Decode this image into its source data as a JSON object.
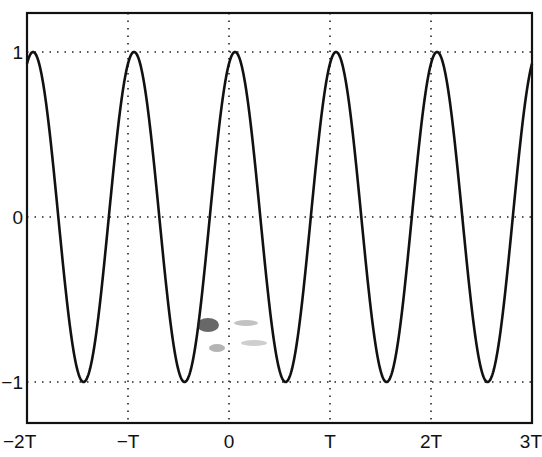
{
  "chart_data": {
    "type": "line",
    "title": "",
    "xlabel": "",
    "ylabel": "",
    "xlim": [
      -2,
      3
    ],
    "ylim": [
      -1.2,
      1.2
    ],
    "x_unit": "T",
    "grid": true,
    "x_ticks": [
      {
        "value": -2,
        "label": "−2T"
      },
      {
        "value": -1,
        "label": "−T"
      },
      {
        "value": 0,
        "label": "0"
      },
      {
        "value": 1,
        "label": "T"
      },
      {
        "value": 2,
        "label": "2T"
      },
      {
        "value": 3,
        "label": "3T"
      }
    ],
    "y_ticks": [
      {
        "value": 1,
        "label": "1"
      },
      {
        "value": 0,
        "label": "0"
      },
      {
        "value": -1,
        "label": "−1"
      }
    ],
    "series": [
      {
        "name": "periodic signal",
        "function": "cos(2*pi*(t - 0.06))",
        "period": 1,
        "amplitude": 1,
        "phase_shift": 0.06,
        "peaks_at": [
          -1.94,
          -0.94,
          0.06,
          1.06,
          2.06
        ],
        "troughs_at": [
          -1.44,
          -0.44,
          0.56,
          1.56,
          2.56
        ],
        "x": [
          -2.0,
          -1.94,
          -1.69,
          -1.44,
          -1.19,
          -0.94,
          -0.69,
          -0.44,
          -0.19,
          0.06,
          0.31,
          0.56,
          0.81,
          1.06,
          1.31,
          1.56,
          1.81,
          2.06,
          2.31,
          2.56,
          2.81,
          3.0
        ],
        "values": [
          0.93,
          1.0,
          0.0,
          -1.0,
          0.0,
          1.0,
          0.0,
          -1.0,
          0.0,
          1.0,
          0.0,
          -1.0,
          0.0,
          1.0,
          0.0,
          -1.0,
          0.0,
          1.0,
          0.0,
          -1.0,
          0.0,
          0.93
        ]
      }
    ]
  }
}
